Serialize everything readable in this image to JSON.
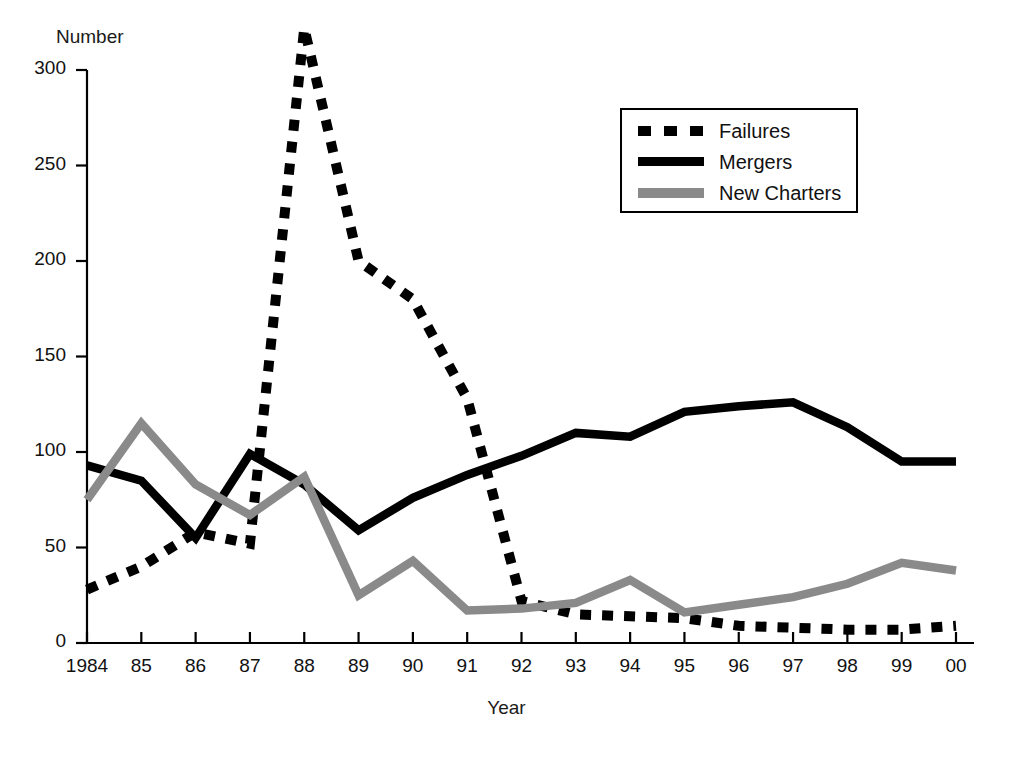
{
  "chart_data": {
    "type": "line",
    "title": "",
    "xlabel": "Year",
    "ylabel": "Number",
    "x": [
      "1984",
      "85",
      "86",
      "87",
      "88",
      "89",
      "90",
      "91",
      "92",
      "93",
      "94",
      "95",
      "96",
      "97",
      "98",
      "99",
      "00"
    ],
    "xlim": [
      0,
      16
    ],
    "ylim": [
      0,
      300
    ],
    "yticks": [
      0,
      50,
      100,
      150,
      200,
      250,
      300
    ],
    "ytick_labels": [
      "0",
      "50",
      "100",
      "150",
      "200",
      "250",
      "300"
    ],
    "grid": false,
    "legend_position": "upper right",
    "series": [
      {
        "name": "Failures",
        "style": "dotted",
        "color": "#000000",
        "values": [
          28,
          40,
          58,
          52,
          322,
          200,
          180,
          128,
          22,
          15,
          14,
          13,
          9,
          8,
          7,
          7,
          9
        ]
      },
      {
        "name": "Mergers",
        "style": "solid",
        "color": "#000000",
        "values": [
          93,
          85,
          55,
          99,
          83,
          59,
          76,
          88,
          98,
          110,
          108,
          121,
          124,
          126,
          113,
          95,
          95
        ]
      },
      {
        "name": "New Charters",
        "style": "solid",
        "color": "#8a8a8a",
        "values": [
          75,
          115,
          83,
          67,
          87,
          25,
          43,
          17,
          18,
          21,
          33,
          16,
          20,
          24,
          31,
          42,
          38
        ]
      }
    ]
  },
  "legend": {
    "items": [
      {
        "label": "Failures",
        "swatch": "dotted-black"
      },
      {
        "label": "Mergers",
        "swatch": "solid-black"
      },
      {
        "label": "New Charters",
        "swatch": "solid-gray"
      }
    ]
  },
  "axes": {
    "y_title": "Number",
    "x_title": "Year"
  }
}
